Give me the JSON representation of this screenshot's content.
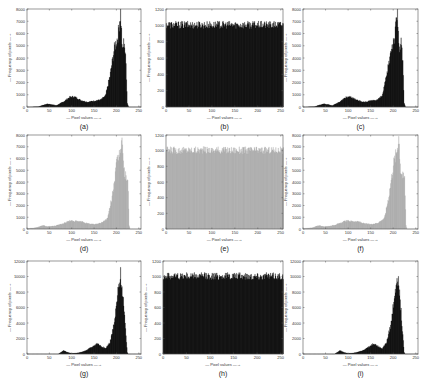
{
  "chart_data": [
    {
      "id": "a",
      "type": "bar",
      "title": "",
      "caption": "(a)",
      "xlabel": "Pixel values",
      "ylabel": "Frequency of pixels",
      "xlim": [
        0,
        255
      ],
      "ylim": [
        0,
        8000
      ],
      "xticks": [
        0,
        50,
        100,
        150,
        200,
        250
      ],
      "yticks": [
        0,
        1000,
        2000,
        3000,
        4000,
        5000,
        6000,
        7000,
        8000
      ],
      "color": "#1a1a1a",
      "grid": false,
      "profile": [
        [
          0,
          0
        ],
        [
          25,
          20
        ],
        [
          35,
          150
        ],
        [
          45,
          250
        ],
        [
          55,
          200
        ],
        [
          65,
          120
        ],
        [
          80,
          400
        ],
        [
          95,
          800
        ],
        [
          105,
          850
        ],
        [
          120,
          550
        ],
        [
          135,
          400
        ],
        [
          150,
          500
        ],
        [
          165,
          600
        ],
        [
          175,
          900
        ],
        [
          185,
          2500
        ],
        [
          195,
          4800
        ],
        [
          203,
          5800
        ],
        [
          209,
          7800
        ],
        [
          213,
          4500
        ],
        [
          217,
          5500
        ],
        [
          221,
          3500
        ],
        [
          224,
          300
        ],
        [
          227,
          0
        ],
        [
          255,
          0
        ]
      ]
    },
    {
      "id": "b",
      "type": "bar",
      "title": "",
      "caption": "(b)",
      "xlabel": "Pixel values",
      "ylabel": "Frequency of pixels",
      "xlim": [
        0,
        255
      ],
      "ylim": [
        0,
        1200
      ],
      "xticks": [
        0,
        50,
        100,
        150,
        200,
        250
      ],
      "yticks": [
        0,
        200,
        400,
        600,
        800,
        1000,
        1200
      ],
      "color": "#1a1a1a",
      "grid": false,
      "uniform_level": 1000,
      "noise": 60
    },
    {
      "id": "c",
      "type": "bar",
      "title": "",
      "caption": "(c)",
      "xlabel": "Pixel values",
      "ylabel": "Frequency of pixels",
      "xlim": [
        0,
        255
      ],
      "ylim": [
        0,
        8000
      ],
      "xticks": [
        0,
        50,
        100,
        150,
        200,
        250
      ],
      "yticks": [
        0,
        1000,
        2000,
        3000,
        4000,
        5000,
        6000,
        7000,
        8000
      ],
      "color": "#1a1a1a",
      "grid": false,
      "profile": [
        [
          0,
          0
        ],
        [
          25,
          20
        ],
        [
          35,
          150
        ],
        [
          45,
          250
        ],
        [
          55,
          200
        ],
        [
          65,
          120
        ],
        [
          80,
          400
        ],
        [
          95,
          800
        ],
        [
          105,
          850
        ],
        [
          120,
          550
        ],
        [
          135,
          400
        ],
        [
          150,
          500
        ],
        [
          165,
          600
        ],
        [
          175,
          900
        ],
        [
          185,
          2500
        ],
        [
          195,
          4800
        ],
        [
          203,
          5800
        ],
        [
          209,
          7800
        ],
        [
          213,
          4500
        ],
        [
          217,
          5500
        ],
        [
          221,
          3500
        ],
        [
          224,
          300
        ],
        [
          227,
          0
        ],
        [
          255,
          0
        ]
      ]
    },
    {
      "id": "d",
      "type": "bar",
      "title": "",
      "caption": "(d)",
      "xlabel": "Pixel values",
      "ylabel": "Frequency of pixels",
      "xlim": [
        0,
        255
      ],
      "ylim": [
        0,
        8000
      ],
      "xticks": [
        0,
        50,
        100,
        150,
        200,
        250
      ],
      "yticks": [
        0,
        1000,
        2000,
        3000,
        4000,
        5000,
        6000,
        7000,
        8000
      ],
      "color": "#b4b4b4",
      "grid": false,
      "profile": [
        [
          0,
          0
        ],
        [
          5,
          60
        ],
        [
          20,
          100
        ],
        [
          35,
          300
        ],
        [
          45,
          200
        ],
        [
          60,
          250
        ],
        [
          80,
          450
        ],
        [
          95,
          700
        ],
        [
          110,
          650
        ],
        [
          125,
          600
        ],
        [
          135,
          450
        ],
        [
          150,
          400
        ],
        [
          165,
          500
        ],
        [
          180,
          900
        ],
        [
          190,
          2800
        ],
        [
          200,
          5500
        ],
        [
          207,
          6500
        ],
        [
          212,
          7900
        ],
        [
          216,
          5000
        ],
        [
          220,
          4500
        ],
        [
          225,
          4300
        ],
        [
          228,
          300
        ],
        [
          230,
          0
        ],
        [
          255,
          0
        ]
      ]
    },
    {
      "id": "e",
      "type": "bar",
      "title": "",
      "caption": "(e)",
      "xlabel": "Pixel values",
      "ylabel": "Frequency of pixels",
      "xlim": [
        0,
        255
      ],
      "ylim": [
        0,
        1200
      ],
      "xticks": [
        0,
        50,
        100,
        150,
        200,
        250
      ],
      "yticks": [
        0,
        200,
        400,
        600,
        800,
        1000,
        1200
      ],
      "color": "#b4b4b4",
      "grid": false,
      "uniform_level": 1000,
      "noise": 60
    },
    {
      "id": "f",
      "type": "bar",
      "title": "",
      "caption": "(f)",
      "xlabel": "Pixel values",
      "ylabel": "Frequency of pixels",
      "xlim": [
        0,
        255
      ],
      "ylim": [
        0,
        8000
      ],
      "xticks": [
        0,
        50,
        100,
        150,
        200,
        250
      ],
      "yticks": [
        0,
        1000,
        2000,
        3000,
        4000,
        5000,
        6000,
        7000,
        8000
      ],
      "color": "#b4b4b4",
      "grid": false,
      "profile": [
        [
          0,
          0
        ],
        [
          5,
          60
        ],
        [
          20,
          100
        ],
        [
          35,
          300
        ],
        [
          45,
          200
        ],
        [
          60,
          250
        ],
        [
          80,
          450
        ],
        [
          95,
          700
        ],
        [
          110,
          650
        ],
        [
          125,
          600
        ],
        [
          135,
          450
        ],
        [
          150,
          400
        ],
        [
          165,
          500
        ],
        [
          180,
          900
        ],
        [
          190,
          2800
        ],
        [
          200,
          5500
        ],
        [
          207,
          6500
        ],
        [
          212,
          7900
        ],
        [
          216,
          5000
        ],
        [
          220,
          4500
        ],
        [
          225,
          4300
        ],
        [
          228,
          300
        ],
        [
          230,
          0
        ],
        [
          255,
          0
        ]
      ]
    },
    {
      "id": "g",
      "type": "bar",
      "title": "",
      "caption": "(g)",
      "xlabel": "Pixel values",
      "ylabel": "Frequency of pixels",
      "xlim": [
        0,
        255
      ],
      "ylim": [
        0,
        12000
      ],
      "xticks": [
        0,
        50,
        100,
        150,
        200,
        250
      ],
      "yticks": [
        0,
        2000,
        4000,
        6000,
        8000,
        10000,
        12000
      ],
      "color": "#1a1a1a",
      "grid": false,
      "profile": [
        [
          0,
          0
        ],
        [
          70,
          0
        ],
        [
          75,
          200
        ],
        [
          82,
          450
        ],
        [
          90,
          200
        ],
        [
          100,
          80
        ],
        [
          115,
          150
        ],
        [
          130,
          400
        ],
        [
          145,
          900
        ],
        [
          157,
          1400
        ],
        [
          165,
          1000
        ],
        [
          175,
          700
        ],
        [
          185,
          1500
        ],
        [
          195,
          4000
        ],
        [
          203,
          8000
        ],
        [
          209,
          10300
        ],
        [
          215,
          7000
        ],
        [
          220,
          3000
        ],
        [
          224,
          200
        ],
        [
          226,
          0
        ],
        [
          255,
          0
        ]
      ]
    },
    {
      "id": "h",
      "type": "bar",
      "title": "",
      "caption": "(h)",
      "xlabel": "Pixel values",
      "ylabel": "Frequency of pixels",
      "xlim": [
        0,
        255
      ],
      "ylim": [
        0,
        1200
      ],
      "xticks": [
        0,
        50,
        100,
        150,
        200,
        250
      ],
      "yticks": [
        0,
        200,
        400,
        600,
        800,
        1000,
        1200
      ],
      "color": "#1a1a1a",
      "grid": false,
      "uniform_level": 1000,
      "noise": 60
    },
    {
      "id": "i",
      "type": "bar",
      "title": "",
      "caption": "(i)",
      "xlabel": "Pixel values",
      "ylabel": "Frequency of pixels",
      "xlim": [
        0,
        255
      ],
      "ylim": [
        0,
        12000
      ],
      "xticks": [
        0,
        50,
        100,
        150,
        200,
        250
      ],
      "yticks": [
        0,
        2000,
        4000,
        6000,
        8000,
        10000,
        12000
      ],
      "color": "#1a1a1a",
      "grid": false,
      "profile": [
        [
          0,
          0
        ],
        [
          70,
          0
        ],
        [
          75,
          200
        ],
        [
          82,
          450
        ],
        [
          90,
          200
        ],
        [
          100,
          80
        ],
        [
          115,
          150
        ],
        [
          130,
          400
        ],
        [
          145,
          900
        ],
        [
          157,
          1400
        ],
        [
          165,
          1000
        ],
        [
          175,
          700
        ],
        [
          185,
          1500
        ],
        [
          195,
          4000
        ],
        [
          203,
          8000
        ],
        [
          209,
          10300
        ],
        [
          215,
          7000
        ],
        [
          220,
          3000
        ],
        [
          224,
          200
        ],
        [
          226,
          0
        ],
        [
          255,
          0
        ]
      ]
    }
  ],
  "layout": {
    "panels": [
      {
        "x": 27,
        "y": 9,
        "w": 114,
        "h": 98
      },
      {
        "x": 166,
        "y": 9,
        "w": 117,
        "h": 98
      },
      {
        "x": 303,
        "y": 9,
        "w": 115,
        "h": 98
      },
      {
        "x": 27,
        "y": 135,
        "w": 114,
        "h": 94
      },
      {
        "x": 166,
        "y": 135,
        "w": 117,
        "h": 94
      },
      {
        "x": 303,
        "y": 135,
        "w": 115,
        "h": 94
      },
      {
        "x": 27,
        "y": 261,
        "w": 114,
        "h": 93
      },
      {
        "x": 163,
        "y": 261,
        "w": 120,
        "h": 93
      },
      {
        "x": 303,
        "y": 261,
        "w": 115,
        "h": 93
      }
    ]
  }
}
